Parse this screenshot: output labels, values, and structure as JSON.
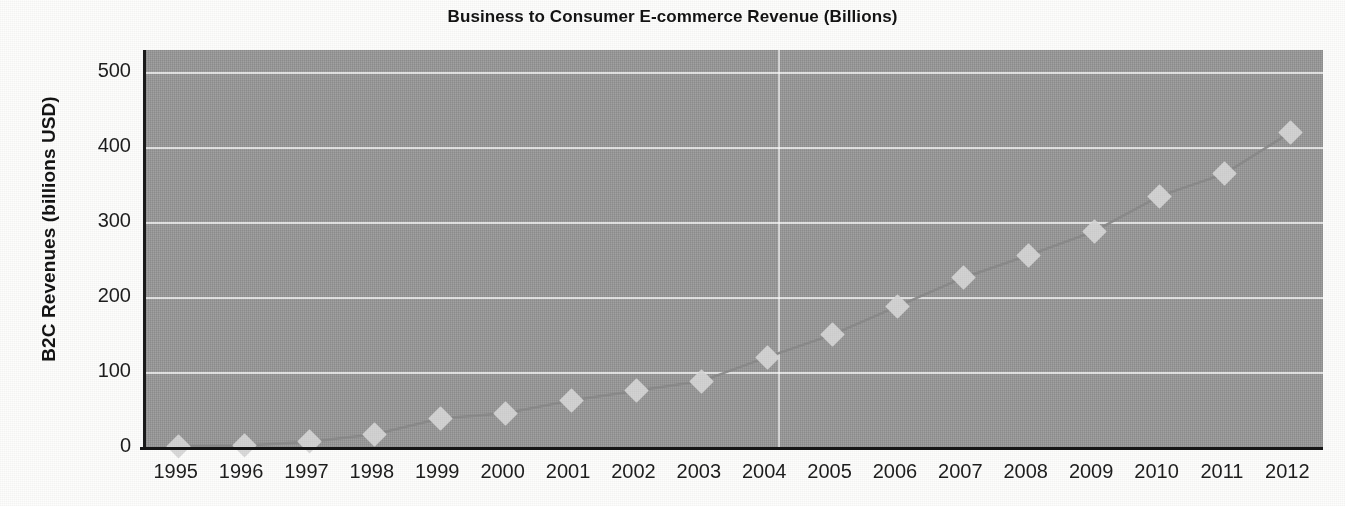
{
  "chart_data": {
    "type": "line",
    "title": "Business to Consumer E-commerce Revenue (Billions)",
    "xlabel": "",
    "ylabel": "B2C Revenues (billions USD)",
    "categories": [
      "1995",
      "1996",
      "1997",
      "1998",
      "1999",
      "2000",
      "2001",
      "2002",
      "2003",
      "2004",
      "2005",
      "2006",
      "2007",
      "2008",
      "2009",
      "2010",
      "2011",
      "2012"
    ],
    "values": [
      1,
      2,
      7,
      17,
      38,
      45,
      62,
      75,
      88,
      120,
      150,
      188,
      226,
      256,
      288,
      335,
      365,
      420
    ],
    "series": [
      {
        "name": "B2C Revenues",
        "values": [
          1,
          2,
          7,
          17,
          38,
          45,
          62,
          75,
          88,
          120,
          150,
          188,
          226,
          256,
          288,
          335,
          365,
          420
        ]
      }
    ],
    "ylim": [
      0,
      530
    ],
    "yticks": [
      0,
      100,
      200,
      300,
      400,
      500
    ],
    "ytick_labels": [
      "0",
      "100",
      "200",
      "300",
      "400",
      "500"
    ],
    "grid": "horizontal gridlines white, one vertical gridline between 2004 and 2005",
    "legend": "none",
    "marker": "diamond",
    "plot_background_color": "#9b9b9b",
    "gridline_color": "#ffffff",
    "line_color": "#8a8a8a",
    "marker_color": "#d8d8d8",
    "axis_color": "#1a1a1a",
    "text_color": "#1d1d1d"
  }
}
